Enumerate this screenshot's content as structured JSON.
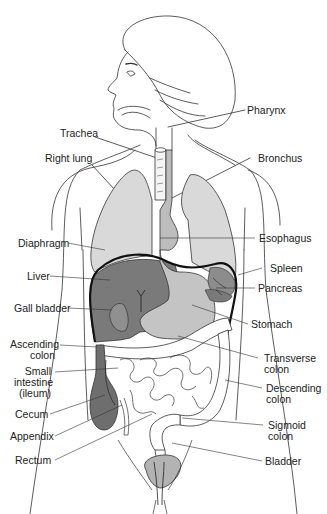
{
  "diagram": {
    "colors": {
      "outline": "#333333",
      "lung": "#d9d9d9",
      "esophagus": "#bdbdbd",
      "liver": "#7a7a7a",
      "stomach": "#c4c4c4",
      "spleen": "#8c8c8c",
      "cecum": "#6e6e6e",
      "bladder": "#b3b3b3",
      "diaphragm": "#111111"
    },
    "labels": {
      "pharynx": "Pharynx",
      "trachea": "Trachea",
      "right_lung": "Right lung",
      "bronchus": "Bronchus",
      "diaphragm": "Diaphragm",
      "esophagus": "Esophagus",
      "liver": "Liver",
      "spleen": "Spleen",
      "pancreas": "Pancreas",
      "gall_bladder": "Gall bladder",
      "stomach": "Stomach",
      "ascending_colon_1": "Ascending",
      "ascending_colon_2": "colon",
      "transverse_colon_1": "Transverse",
      "transverse_colon_2": "colon",
      "small_intestine_1": "Small",
      "small_intestine_2": "intestine",
      "small_intestine_3": "(ileum)",
      "descending_colon_1": "Descending",
      "descending_colon_2": "colon",
      "cecum": "Cecum",
      "appendix": "Appendix",
      "sigmoid_colon_1": "Sigmoid",
      "sigmoid_colon_2": "colon",
      "rectum": "Rectum",
      "bladder": "Bladder"
    }
  }
}
